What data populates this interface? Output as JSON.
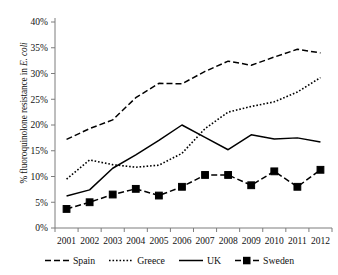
{
  "chart_data": {
    "type": "line",
    "title": "",
    "xlabel": "",
    "ylabel": "% fluoroquinolone resistance in E. coli",
    "ylabel_plain": "% fluoroquinolone resistance in ",
    "ylabel_italic": "E. coli",
    "categories": [
      "2001",
      "2002",
      "2003",
      "2004",
      "2005",
      "2006",
      "2007",
      "2008",
      "2009",
      "2010",
      "2011",
      "2012"
    ],
    "x": [
      2001,
      2002,
      2003,
      2004,
      2005,
      2006,
      2007,
      2008,
      2009,
      2010,
      2011,
      2012
    ],
    "ylim": [
      0,
      40
    ],
    "ytick_values": [
      0,
      5,
      10,
      15,
      20,
      25,
      30,
      35,
      40
    ],
    "ytick_labels": [
      "0%",
      "5%",
      "10%",
      "15%",
      "20%",
      "25%",
      "30%",
      "35%",
      "40%"
    ],
    "grid": false,
    "legend_position": "bottom",
    "series": [
      {
        "name": "Spain",
        "style": "dashed",
        "marker": "none",
        "color": "#000000",
        "values": [
          17.2,
          19.3,
          21.0,
          25.3,
          28.1,
          28.0,
          30.4,
          32.4,
          31.6,
          33.2,
          34.7,
          34.0
        ]
      },
      {
        "name": "Greece",
        "style": "dotted",
        "marker": "none",
        "color": "#000000",
        "values": [
          9.5,
          13.2,
          12.3,
          11.8,
          12.2,
          14.5,
          19.3,
          22.5,
          23.6,
          24.5,
          26.4,
          29.2
        ]
      },
      {
        "name": "UK",
        "style": "solid",
        "marker": "none",
        "color": "#000000",
        "values": [
          6.2,
          7.4,
          11.6,
          14.2,
          17.0,
          20.0,
          17.6,
          15.2,
          18.1,
          17.3,
          17.5,
          16.7
        ]
      },
      {
        "name": "Sweden",
        "style": "dashed",
        "marker": "square",
        "color": "#000000",
        "values": [
          3.7,
          5.0,
          6.5,
          7.6,
          6.3,
          8.0,
          10.3,
          10.3,
          8.3,
          11.0,
          8.0,
          11.3
        ]
      }
    ]
  },
  "legend": {
    "items": [
      {
        "label": "Spain",
        "style": "dashed",
        "marker": "none"
      },
      {
        "label": "Greece",
        "style": "dotted",
        "marker": "none"
      },
      {
        "label": "UK",
        "style": "solid",
        "marker": "none"
      },
      {
        "label": "Sweden",
        "style": "dashed",
        "marker": "square"
      }
    ]
  }
}
